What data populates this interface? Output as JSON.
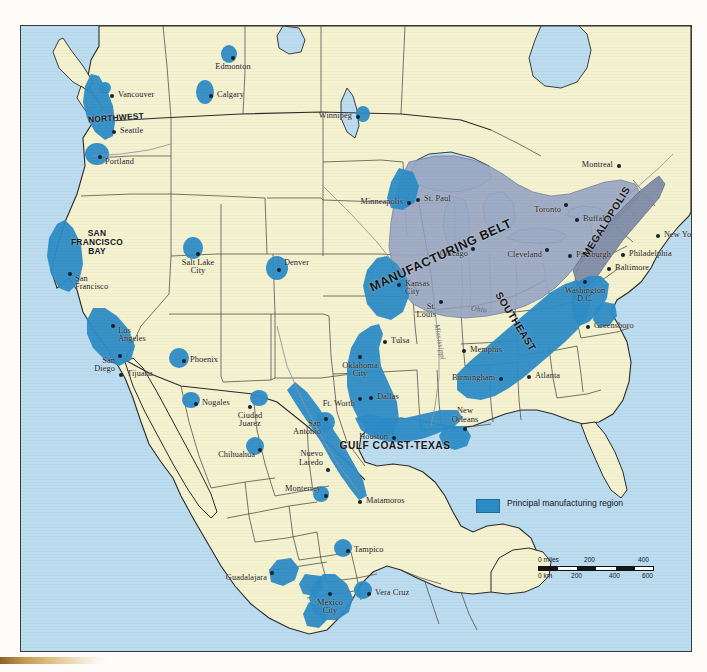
{
  "map": {
    "title": "Principal Manufacturing Regions of North America",
    "colors": {
      "ocean": "#bcdcf0",
      "land": "#f5f2d0",
      "manufacturing_belt": "#9aa8c4",
      "principal_region": "#2d8cc6",
      "megalopolis": "#7f8ba8",
      "border": "#3a3a3a"
    }
  },
  "legend": {
    "swatch_color": "#2d8cc6",
    "label": "Principal manufacturing\nregion"
  },
  "scale": {
    "miles_label": "0 miles",
    "miles_ticks": [
      "200",
      "400"
    ],
    "km_label": "0 km",
    "km_ticks": [
      "200",
      "400",
      "600"
    ]
  },
  "regions": [
    {
      "name": "NORTHWEST",
      "text": "NORTHWEST",
      "size": "sm",
      "x": 95,
      "y": 92,
      "rot": -4
    },
    {
      "name": "SAN FRANCISCO BAY",
      "text": "SAN\nFRANCISCO\nBAY",
      "size": "sm",
      "x": 76,
      "y": 216,
      "rot": 0
    },
    {
      "name": "MANUFACTURING BELT",
      "text": "MANUFACTURING BELT",
      "size": "lg",
      "x": 420,
      "y": 230,
      "rot": -25
    },
    {
      "name": "MEGALOPOLIS",
      "text": "MEGALOPOLIS",
      "size": "md",
      "x": 586,
      "y": 196,
      "rot": -58
    },
    {
      "name": "SOUTHEAST",
      "text": "SOUTHEAST",
      "size": "md",
      "x": 494,
      "y": 296,
      "rot": 58
    },
    {
      "name": "GULF COAST-TEXAS",
      "text": "GULF COAST-TEXAS",
      "size": "md",
      "x": 374,
      "y": 420,
      "rot": 0
    }
  ],
  "rivers": [
    {
      "name": "Mississippi",
      "text": "Mississippi",
      "x": 419,
      "y": 316,
      "rot": 80
    },
    {
      "name": "Ohio",
      "text": "Ohio",
      "x": 458,
      "y": 283,
      "rot": 6
    }
  ],
  "cities": [
    {
      "name": "Edmonton",
      "text": "Edmonton",
      "x": 212,
      "y": 32,
      "pos": "c"
    },
    {
      "name": "Calgary",
      "text": "Calgary",
      "x": 190,
      "y": 70,
      "pos": "r"
    },
    {
      "name": "Winnipeg",
      "text": "Winnipeg",
      "x": 337,
      "y": 91,
      "pos": "l"
    },
    {
      "name": "Vancouver",
      "text": "Vancouver",
      "x": 91,
      "y": 70,
      "pos": "r"
    },
    {
      "name": "Seattle",
      "text": "Seattle",
      "x": 93,
      "y": 106,
      "pos": "r"
    },
    {
      "name": "Portland",
      "text": "Portland",
      "x": 79,
      "y": 131,
      "pos": "b"
    },
    {
      "name": "Montreal",
      "text": "Montreal",
      "x": 598,
      "y": 140,
      "pos": "l"
    },
    {
      "name": "Minneapolis",
      "text": "Minneapolis",
      "x": 388,
      "y": 177,
      "pos": "l"
    },
    {
      "name": "St. Paul",
      "text": "St. Paul",
      "x": 397,
      "y": 174,
      "pos": "r"
    },
    {
      "name": "Toronto",
      "text": "Toronto",
      "x": 545,
      "y": 179,
      "pos": "lb"
    },
    {
      "name": "Buffalo",
      "text": "Buffalo",
      "x": 556,
      "y": 194,
      "pos": "r"
    },
    {
      "name": "Chicago",
      "text": "Chicago",
      "x": 452,
      "y": 223,
      "pos": "lb"
    },
    {
      "name": "Cleveland",
      "text": "Cleveland",
      "x": 526,
      "y": 224,
      "pos": "lb"
    },
    {
      "name": "Pittsburgh",
      "text": "Pittsburgh",
      "x": 549,
      "y": 230,
      "pos": "r"
    },
    {
      "name": "New York",
      "text": "New York",
      "x": 637,
      "y": 210,
      "pos": "r"
    },
    {
      "name": "Philadelphia",
      "text": "Philadelphia",
      "x": 602,
      "y": 229,
      "pos": "r"
    },
    {
      "name": "Baltimore",
      "text": "Baltimore",
      "x": 588,
      "y": 243,
      "pos": "r"
    },
    {
      "name": "Washington D.C.",
      "text": "Washington\nD.C.",
      "x": 564,
      "y": 256,
      "pos": "c"
    },
    {
      "name": "Salt Lake City",
      "text": "Salt Lake\nCity",
      "x": 177,
      "y": 228,
      "pos": "c"
    },
    {
      "name": "Denver",
      "text": "Denver",
      "x": 258,
      "y": 244,
      "pos": "t"
    },
    {
      "name": "San Francisco",
      "text": "San\nFrancisco",
      "x": 49,
      "y": 248,
      "pos": "b"
    },
    {
      "name": "Kansas City",
      "text": "Kansas\nCity",
      "x": 378,
      "y": 259,
      "pos": "r"
    },
    {
      "name": "St. Louis",
      "text": "St.\nLouis",
      "x": 420,
      "y": 276,
      "pos": "lb"
    },
    {
      "name": "Greensboro",
      "text": "Greensboro",
      "x": 567,
      "y": 301,
      "pos": "r"
    },
    {
      "name": "Los Angeles",
      "text": "Los\nAngeles",
      "x": 92,
      "y": 300,
      "pos": "b"
    },
    {
      "name": "San Diego",
      "text": "San\nDiego",
      "x": 99,
      "y": 330,
      "pos": "lb"
    },
    {
      "name": "Memphis",
      "text": "Memphis",
      "x": 443,
      "y": 325,
      "pos": "r"
    },
    {
      "name": "Phoenix",
      "text": "Phoenix",
      "x": 163,
      "y": 335,
      "pos": "r"
    },
    {
      "name": "Tulsa",
      "text": "Tulsa",
      "x": 364,
      "y": 316,
      "pos": "r"
    },
    {
      "name": "Oklahoma City",
      "text": "Oklahoma\nCity",
      "x": 339,
      "y": 331,
      "pos": "c"
    },
    {
      "name": "Tijuana",
      "text": "Tijuana",
      "x": 100,
      "y": 349,
      "pos": "r"
    },
    {
      "name": "Birmingham",
      "text": "Birmingham",
      "x": 480,
      "y": 353,
      "pos": "l"
    },
    {
      "name": "Atlanta",
      "text": "Atlanta",
      "x": 508,
      "y": 351,
      "pos": "r"
    },
    {
      "name": "Dallas",
      "text": "Dallas",
      "x": 350,
      "y": 372,
      "pos": "r"
    },
    {
      "name": "Ft. Worth",
      "text": "Ft. Worth",
      "x": 339,
      "y": 373,
      "pos": "lb"
    },
    {
      "name": "Nogales",
      "text": "Nogales",
      "x": 175,
      "y": 378,
      "pos": "r"
    },
    {
      "name": "Ciudad Juarez",
      "text": "Ciudad\nJuarez",
      "x": 229,
      "y": 381,
      "pos": "c"
    },
    {
      "name": "San Antonio",
      "text": "San\nAntonio",
      "x": 305,
      "y": 393,
      "pos": "lb"
    },
    {
      "name": "Houston",
      "text": "Houston",
      "x": 373,
      "y": 412,
      "pos": "l"
    },
    {
      "name": "New Orleans",
      "text": "New\nOrleans",
      "x": 444,
      "y": 403,
      "pos": "ct"
    },
    {
      "name": "Chihuahua",
      "text": "Chihuahua",
      "x": 239,
      "y": 424,
      "pos": "lb"
    },
    {
      "name": "Nuevo Laredo",
      "text": "Nuevo\nLaredo",
      "x": 307,
      "y": 444,
      "pos": "lt"
    },
    {
      "name": "Monterrey",
      "text": "Monterrey",
      "x": 305,
      "y": 470,
      "pos": "lt"
    },
    {
      "name": "Matamoros",
      "text": "Matamoros",
      "x": 339,
      "y": 476,
      "pos": "r"
    },
    {
      "name": "Tampico",
      "text": "Tampico",
      "x": 327,
      "y": 525,
      "pos": "r"
    },
    {
      "name": "Guadalajara",
      "text": "Guadalajara",
      "x": 251,
      "y": 547,
      "pos": "lb"
    },
    {
      "name": "Vera Cruz",
      "text": "Vera Cruz",
      "x": 348,
      "y": 568,
      "pos": "r"
    },
    {
      "name": "Mexico City",
      "text": "Mexico\nCity",
      "x": 309,
      "y": 568,
      "pos": "c"
    }
  ]
}
